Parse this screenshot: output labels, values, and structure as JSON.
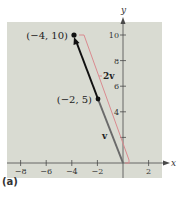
{
  "figure": {
    "panel_label": "(a)",
    "background": "#d9dbd2",
    "axis_color": "#4a4a4a",
    "vector_dark_color": "#111111",
    "vector_gray_color": "#6a6a6a",
    "bracket_color": "#d98a8f"
  },
  "axes": {
    "x_label": "x",
    "y_label": "y",
    "x_ticks": [
      {
        "value": -8,
        "label": "−8"
      },
      {
        "value": -6,
        "label": "−6"
      },
      {
        "value": -4,
        "label": "−4"
      },
      {
        "value": -2,
        "label": "−2"
      },
      {
        "value": 2,
        "label": "2"
      }
    ],
    "y_ticks": [
      {
        "value": 2,
        "label": ""
      },
      {
        "value": 4,
        "label": "4"
      },
      {
        "value": 6,
        "label": "6"
      },
      {
        "value": 8,
        "label": "8"
      },
      {
        "value": 10,
        "label": "10"
      }
    ]
  },
  "points": [
    {
      "name": "2v-tip",
      "label": "(−4, 10)",
      "x": -4,
      "y": 10
    },
    {
      "name": "v-tip",
      "label": "(−2, 5)",
      "x": -2,
      "y": 5
    }
  ],
  "vectors": [
    {
      "name": "v",
      "label": "v",
      "from": [
        0,
        0
      ],
      "to": [
        -2,
        5
      ]
    },
    {
      "name": "2v",
      "label": "2v",
      "from": [
        0,
        0
      ],
      "to": [
        -4,
        10
      ]
    }
  ],
  "chart_data": {
    "type": "line",
    "title": "",
    "xlabel": "x",
    "ylabel": "y",
    "xlim": [
      -8.8,
      3
    ],
    "ylim": [
      -1.2,
      11
    ],
    "x_ticks": [
      -8,
      -6,
      -4,
      -2,
      2
    ],
    "y_ticks": [
      2,
      4,
      6,
      8,
      10
    ],
    "grid": false,
    "series": [
      {
        "name": "v",
        "x": [
          0,
          -2
        ],
        "y": [
          0,
          5
        ]
      },
      {
        "name": "2v",
        "x": [
          0,
          -4
        ],
        "y": [
          0,
          10
        ]
      }
    ],
    "annotations": [
      {
        "text": "(−4, 10)",
        "x": -4,
        "y": 10
      },
      {
        "text": "(−2, 5)",
        "x": -2,
        "y": 5
      },
      {
        "text": "v",
        "x": -1.3,
        "y": 2
      },
      {
        "text": "2v",
        "x": -1.3,
        "y": 7
      }
    ]
  }
}
